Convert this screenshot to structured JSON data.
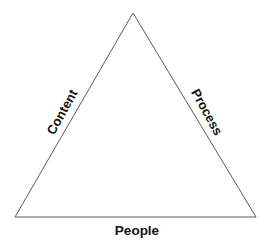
{
  "diagram": {
    "type": "triangle-model",
    "title": "",
    "shape": {
      "name": "triangle",
      "stroke_color": "#5a5a5a",
      "fill_color": "#ffffff",
      "stroke_width": 1,
      "vertices": {
        "apex": {
          "x": 133,
          "y": 13
        },
        "bottom_left": {
          "x": 15,
          "y": 217
        },
        "bottom_right": {
          "x": 256,
          "y": 217
        }
      }
    },
    "labels": [
      {
        "id": "content",
        "text": "Content",
        "edge": "left",
        "rotation_deg": -61,
        "color": "#141414",
        "weight": "bold"
      },
      {
        "id": "process",
        "text": "Process",
        "edge": "right",
        "rotation_deg": 61,
        "color": "#141414",
        "weight": "bold"
      },
      {
        "id": "people",
        "text": "People",
        "edge": "bottom",
        "rotation_deg": 0,
        "color": "#141414",
        "weight": "bold"
      }
    ]
  },
  "canvas": {
    "background_color": "#ffffff",
    "width": 273,
    "height": 251
  }
}
